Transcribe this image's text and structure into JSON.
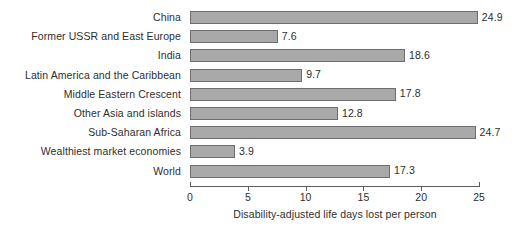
{
  "chart_data": {
    "type": "bar",
    "orientation": "horizontal",
    "title": "",
    "xlabel": "Disability-adjusted life days lost per person",
    "ylabel": "",
    "xlim": [
      0,
      25
    ],
    "xticks": [
      0,
      5,
      10,
      15,
      20,
      25
    ],
    "xtick_labels": [
      "0",
      "5",
      "10",
      "15",
      "20",
      "25"
    ],
    "grid": false,
    "legend": null,
    "bar_color": "#a9a9a9",
    "bar_edge_color": "#6e6e6e",
    "categories": [
      "China",
      "Former USSR and East Europe",
      "India",
      "Latin America and the Caribbean",
      "Middle Eastern Crescent",
      "Other Asia and islands",
      "Sub-Saharan Africa",
      "Wealthiest market economies",
      "World"
    ],
    "values": [
      24.9,
      7.6,
      18.6,
      9.7,
      17.8,
      12.8,
      24.7,
      3.9,
      17.3
    ],
    "value_labels": [
      "24.9",
      "7.6",
      "18.6",
      "9.7",
      "17.8",
      "12.8",
      "24.7",
      "3.9",
      "17.3"
    ]
  }
}
